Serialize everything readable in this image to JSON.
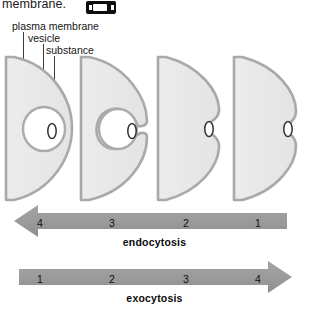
{
  "header": {
    "cropped_text": "membrane.",
    "icon_name": "cassette-tape-icon"
  },
  "labels": {
    "plasma_membrane": "plasma membrane",
    "vesicle": "vesicle",
    "substance": "substance"
  },
  "colors": {
    "cell_fill": "#e9e9e9",
    "membrane_stroke": "#a8a8a8",
    "vesicle_fill": "#ffffff",
    "substance_stroke": "#2e2e2e",
    "arrow_fill": "#9b9b9b",
    "text": "#111111"
  },
  "diagram": {
    "stage_count": 4,
    "stages": [
      {
        "id": "stage-1",
        "description": "vesicle fully internalized inside cell with substance enclosed"
      },
      {
        "id": "stage-2",
        "description": "vesicle connected to plasma membrane by a narrow neck"
      },
      {
        "id": "stage-3",
        "description": "deep membrane invagination around substance"
      },
      {
        "id": "stage-4",
        "description": "shallow membrane indentation, substance outside cell"
      }
    ]
  },
  "arrows": {
    "endocytosis": {
      "caption": "endocytosis",
      "direction": "left",
      "numbers": [
        "4",
        "3",
        "2",
        "1"
      ]
    },
    "exocytosis": {
      "caption": "exocytosis",
      "direction": "right",
      "numbers": [
        "1",
        "2",
        "3",
        "4"
      ]
    }
  }
}
